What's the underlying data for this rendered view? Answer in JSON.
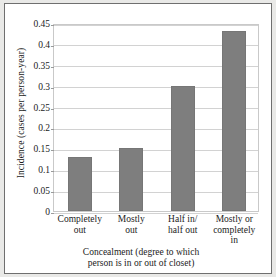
{
  "chart_data": {
    "type": "bar",
    "title": "",
    "categories": [
      "Completely\nout",
      "Mostly\nout",
      "Half in/\nhalf out",
      "Mostly or\ncompletely\nin"
    ],
    "category_lines": [
      [
        "Completely",
        "out"
      ],
      [
        "Mostly",
        "out"
      ],
      [
        "Half in/",
        "half out"
      ],
      [
        "Mostly or",
        "completely",
        "in"
      ]
    ],
    "values": [
      0.13,
      0.15,
      0.3,
      0.43
    ],
    "xlabel": "Concealment (degree to which person is in or out of closet)",
    "xlabel_lines": [
      "Concealment (degree to which",
      "person is in or out of closet)"
    ],
    "ylabel": "Incidence (cases per person-year)",
    "ylim": [
      0,
      0.45
    ],
    "yticks": [
      0,
      0.05,
      0.1,
      0.15,
      0.2,
      0.25,
      0.3,
      0.35,
      0.4,
      0.45
    ],
    "ytick_labels": [
      "0",
      "0.05",
      "0.1",
      "0.15",
      "0.2",
      "0.25",
      "0.3",
      "0.35",
      "0.4",
      "0.45"
    ],
    "grid": true,
    "legend": null,
    "legend_position": "none",
    "colors": {
      "bar_fill": "#7e7e7e",
      "bar_edge": "#767676",
      "gridline": "#d2d2d2",
      "plot_border": "#c9c9c9",
      "figure_border": "#6f6f6f",
      "figure_background": "#e9e9e7",
      "plot_background": "#ffffff",
      "text": "#1b1b1b"
    }
  }
}
